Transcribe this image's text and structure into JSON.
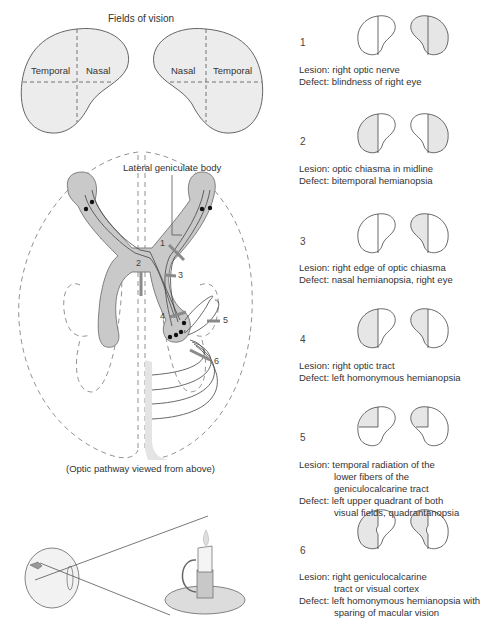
{
  "fields_of_vision": {
    "title": "Fields of vision",
    "left_eye": {
      "temporal": "Temporal",
      "nasal": "Nasal"
    },
    "right_eye": {
      "nasal": "Nasal",
      "temporal": "Temporal"
    }
  },
  "pathway": {
    "label_lgb": "Lateral geniculate body",
    "caption": "(Optic pathway viewed from above)",
    "lesion_markers": [
      "1",
      "2",
      "3",
      "4",
      "5",
      "6"
    ]
  },
  "cases": [
    {
      "num": "1",
      "lesion": "Lesion: right optic nerve",
      "defect": "Defect: blindness of right eye",
      "lesion_extra": [],
      "defect_extra": []
    },
    {
      "num": "2",
      "lesion": "Lesion: optic chiasma in midline",
      "defect": "Defect: bitemporal hemianopsia",
      "lesion_extra": [],
      "defect_extra": []
    },
    {
      "num": "3",
      "lesion": "Lesion: right edge of optic chiasma",
      "defect": "Defect: nasal hemianopsia, right eye",
      "lesion_extra": [],
      "defect_extra": []
    },
    {
      "num": "4",
      "lesion": "Lesion: right optic tract",
      "defect": "Defect: left homonymous hemianopsia",
      "lesion_extra": [],
      "defect_extra": []
    },
    {
      "num": "5",
      "lesion": "Lesion: temporal radiation of the",
      "lesion_extra": [
        "lower fibers of the",
        "geniculocalcarine tract"
      ],
      "defect": "Defect: left upper quadrant of both",
      "defect_extra": [
        "visual fields, quadrantanopsia"
      ]
    },
    {
      "num": "6",
      "lesion": "Lesion: right geniculocalcarine",
      "lesion_extra": [
        "tract or visual cortex"
      ],
      "defect": "Defect: left homonymous hemianopsia with",
      "defect_extra": [
        "sparing of macular vision"
      ]
    }
  ],
  "colors": {
    "fill": "#e6e6e6",
    "stroke": "#555555",
    "pathway_fill": "#c8c8c8",
    "lesion_bar": "#8a8a8a"
  }
}
